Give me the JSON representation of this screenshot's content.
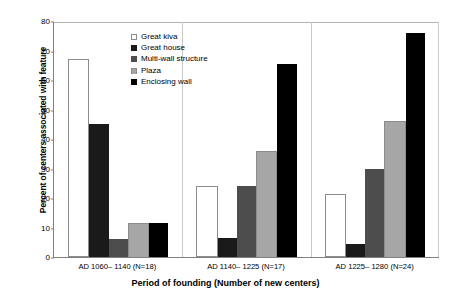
{
  "chart_data": {
    "type": "bar",
    "title": "",
    "xlabel": "Period of founding (Number of new centers)",
    "ylabel": "Percent of centers associated with feature",
    "ylim": [
      0,
      80
    ],
    "yticks": [
      0,
      10,
      20,
      30,
      40,
      50,
      60,
      70,
      80
    ],
    "grid": false,
    "legend_position": "inside-top-center",
    "categories": [
      "AD 1060– 1140 (N=18)",
      "AD 1140– 1225 (N=17)",
      "AD 1225– 1280 (N=24)"
    ],
    "series": [
      {
        "name": "Great kiva",
        "color": "#ffffff",
        "values": [
          67,
          24,
          21.5
        ]
      },
      {
        "name": "Great house",
        "color": "#1a1a1a",
        "values": [
          45,
          6.5,
          4.5
        ]
      },
      {
        "name": "Multi-wall structure",
        "color": "#4d4d4d",
        "values": [
          6,
          24,
          30
        ]
      },
      {
        "name": "Plaza",
        "color": "#a6a6a6",
        "values": [
          11.5,
          36,
          46
        ]
      },
      {
        "name": "Enclosing wall",
        "color": "#000000",
        "values": [
          11.5,
          65.5,
          76
        ]
      }
    ]
  }
}
